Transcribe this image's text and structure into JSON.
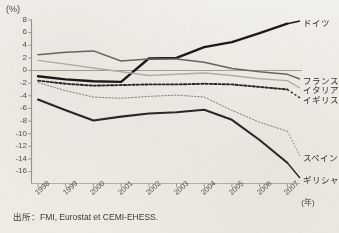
{
  "chart_data": {
    "type": "line",
    "title": "",
    "subtitle": "",
    "xlabel": "(年)",
    "ylabel": "(%)",
    "x": [
      1998,
      1999,
      2000,
      2001,
      2002,
      2003,
      2004,
      2005,
      2006,
      2007
    ],
    "xticklabels": [
      "1998",
      "1999",
      "2000",
      "2001",
      "2002",
      "2003",
      "2004",
      "2005",
      "2006",
      "2007"
    ],
    "ylim": [
      -16,
      8
    ],
    "yticks": [
      8,
      6,
      4,
      2,
      0,
      -2,
      -4,
      -6,
      -8,
      -10,
      -12,
      -14,
      -16
    ],
    "yticklabels": [
      "8",
      "6",
      "4",
      "2",
      "0",
      "-2",
      "-4",
      "-6",
      "-8",
      "-10",
      "-12",
      "-14",
      "-16"
    ],
    "grid": false,
    "legend_position": "right-inline",
    "zero_line": true,
    "series": [
      {
        "name": "ドイツ",
        "label": "ドイツ",
        "color": "#1d1b18",
        "style": "solid",
        "width": 2.4,
        "values": [
          -0.9,
          -1.4,
          -1.7,
          -1.8,
          1.9,
          2.0,
          3.7,
          4.5,
          5.9,
          7.4
        ]
      },
      {
        "name": "フランス",
        "label": "フランス",
        "color": "#6a6760",
        "style": "solid",
        "width": 1.5,
        "values": [
          2.5,
          2.9,
          3.1,
          1.5,
          1.8,
          1.8,
          1.3,
          0.3,
          -0.2,
          -0.6
        ]
      },
      {
        "name": "イタリア",
        "label": "イタリア",
        "color": "#b6b2a8",
        "style": "solid",
        "width": 1.4,
        "values": [
          1.6,
          1.0,
          0.4,
          -0.2,
          -0.8,
          -0.6,
          -0.4,
          -0.8,
          -1.3,
          -1.6
        ]
      },
      {
        "name": "イギリス",
        "label": "イギリス",
        "color": "#2a2825",
        "style": "dotted-bold",
        "width": 1.9,
        "values": [
          -1.6,
          -2.1,
          -2.4,
          -2.3,
          -2.2,
          -2.2,
          -2.1,
          -2.2,
          -2.6,
          -3.0
        ]
      },
      {
        "name": "スペイン",
        "label": "スペイン",
        "color": "#8b8880",
        "style": "dotted-fine",
        "width": 1.0,
        "values": [
          -1.9,
          -3.2,
          -4.2,
          -4.4,
          -4.1,
          -3.9,
          -4.2,
          -6.3,
          -8.2,
          -9.6
        ]
      },
      {
        "name": "ギリシャ",
        "label": "ギリシャ",
        "color": "#2b2926",
        "style": "solid",
        "width": 2.1,
        "values": [
          -4.6,
          -6.3,
          -7.9,
          -7.3,
          -6.8,
          -6.6,
          -6.2,
          -7.8,
          -11.0,
          -14.6
        ]
      }
    ],
    "source": "出所：FMI, Eurostat et CEMI-EHESS."
  },
  "axis": {
    "y_unit": "(%)",
    "x_unit": "(年)"
  }
}
